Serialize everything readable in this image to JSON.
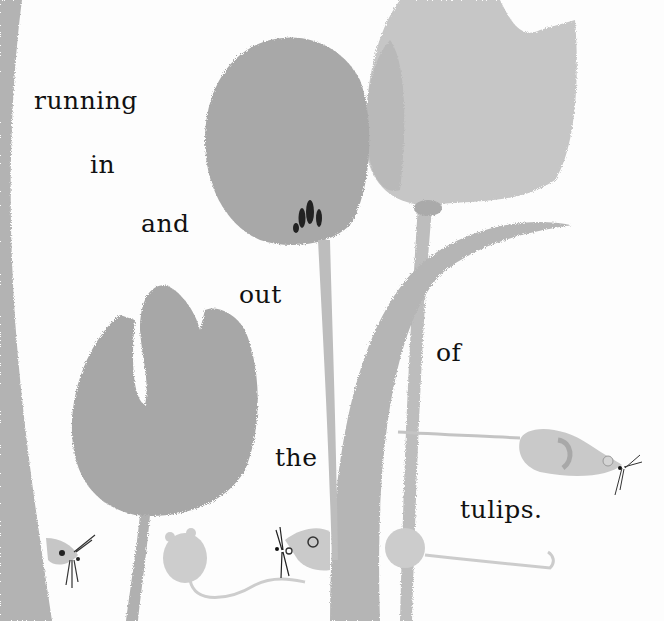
{
  "illustration": {
    "style": "grayscale watercolor picture-book spread",
    "colors": {
      "background": "#fdfdfd",
      "tulip_dark": "#a9a9a9",
      "tulip_light": "#c4c4c4",
      "stem": "#b2b2b2",
      "mouse": "#c9c9c9",
      "text": "#111111"
    },
    "elements": [
      "left-tall-leaf",
      "center-tulip-with-stamen",
      "top-right-tulip",
      "lower-left-tulip",
      "curved-leaf",
      "mouse-right-running",
      "mouse-peeking-left",
      "mouse-back-view",
      "mouse-peeking-center",
      "mouse-behind-stem"
    ]
  },
  "text": {
    "words": [
      "running",
      "in",
      "and",
      "out",
      "of",
      "the",
      "tulips."
    ]
  }
}
